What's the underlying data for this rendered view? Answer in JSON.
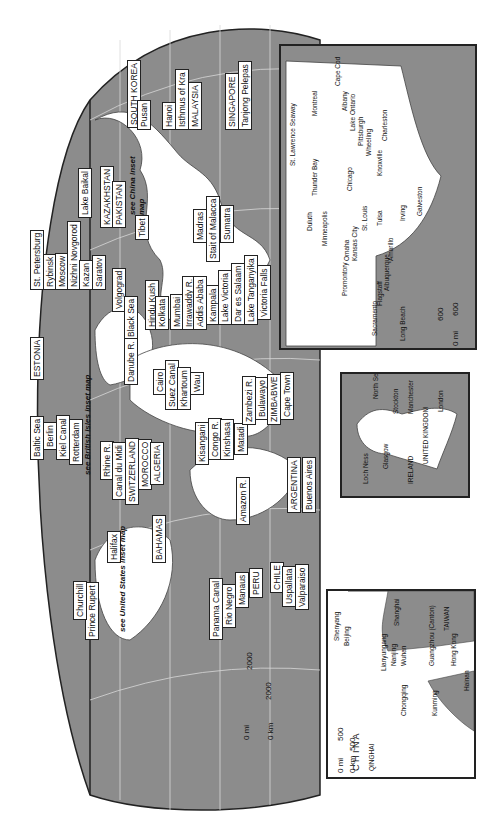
{
  "map": {
    "orientation": "rotated 90 degrees counter-clockwise",
    "colors": {
      "ocean": "#8c8c8c",
      "land": "#ffffff",
      "border": "#222222",
      "grid": "#d8d8d8"
    },
    "labels": {
      "asia": [
        "SOUTH KOREA",
        "Pusan",
        "Hanoi",
        "Isthmus of Kra",
        "MALAYSIA",
        "SINGAPORE",
        "Tanjong Pelepas",
        "Lake Baikal",
        "KAZAKHSTAN",
        "PAKISTAN",
        "Tibet",
        "Madras",
        "Stait of Malacca",
        "Sumatra",
        "Hindu Kush",
        "Kolkata",
        "Mumbai",
        "Irrawaddy R."
      ],
      "europe": [
        "St. Petersburg",
        "Rybinsk",
        "Moscow",
        "Nizhni Novgorod",
        "Kazan",
        "Saratov",
        "Volgograd",
        "Black Sea",
        "ESTONIA",
        "Danube R.",
        "Baltic Sea",
        "Berlin",
        "Kiel Canal",
        "Rotterdam",
        "Rhine R.",
        "Canal du Midi",
        "SWITZERLAND",
        "MOROCCO",
        "ALGERIA"
      ],
      "africa": [
        "Addis Ababa",
        "Kampala",
        "Lake Victoria",
        "Dar es Salaam",
        "Lake Tanganyika",
        "Victoria Falls",
        "Cairo",
        "Suez Canal",
        "Khartoum",
        "Wau",
        "Kisangani",
        "Congo R.",
        "Kinshasa",
        "Matadi",
        "Zambezi R.",
        "Bulawayo",
        "ZIMBABWE",
        "Cape Town"
      ],
      "americas": [
        "Amazon R.",
        "ARGENTINA",
        "Buenos Aires",
        "CHILE",
        "Uspallata",
        "Valparaiso",
        "PERU",
        "Manaus",
        "Rio Negro",
        "Panama Canal",
        "BAHAMAS",
        "Halifax",
        "Prince Rupert",
        "Churchill"
      ],
      "notes": [
        "see China inset map",
        "see British Isles inset map",
        "see United States inset map"
      ]
    },
    "scale": {
      "mi_zero": "0 mi",
      "mi_value": "2000",
      "km_zero": "0 km",
      "km_value": "2000"
    }
  },
  "us_inset": {
    "labels": [
      "Cape Cod",
      "Troy",
      "Albany",
      "Lake Ontario",
      "Pittsburgh",
      "Wheeling",
      "Montreal",
      "St. Lawrence Seaway",
      "Thunder Bay",
      "Buffalo",
      "Chicago",
      "Knoxville",
      "Charleston",
      "Tombigbee R.",
      "Ohio R.",
      "Tennessee R.",
      "Duluth",
      "Minneapolis",
      "Council Bluffs",
      "St. Louis",
      "Mississippi R.",
      "Omaha",
      "Kansas City",
      "Arkansas R.",
      "Tulsa",
      "Irving",
      "Galveston",
      "Royal Gorge",
      "Amarillo",
      "Promontory",
      "Colorado R.",
      "Flagstaff",
      "Albuquerque",
      "Missouri R.",
      "Snake R.",
      "Sacramento",
      "Long Beach",
      "Vancouver",
      "Columbia R."
    ],
    "scale": {
      "mi_zero": "0 mi",
      "mi_value": "600",
      "km_zero": "0 km",
      "km_value": "600"
    }
  },
  "uk_inset": {
    "labels": [
      "North Sea",
      "Stockton",
      "Darlington",
      "Manchester",
      "Liverpool",
      "London",
      "UNITED KINGDOM",
      "Bristol",
      "Glasgow",
      "Loch Ness",
      "IRELAND"
    ],
    "scale": {
      "mi_zero": "0 mi",
      "mi_value": "100",
      "km_zero": "0 km",
      "km_value": "150"
    }
  },
  "china_inset": {
    "labels": [
      "Shenyang",
      "Beijing",
      "Yellow Sea",
      "Shanghai",
      "Hangzhou",
      "TAIWAN",
      "Lianyungang",
      "Nanjing",
      "Wuhan",
      "Guangzhou (Canton)",
      "Hong Kong",
      "Shekou / Yantian",
      "Yangtze R.",
      "Chongqing",
      "Kunming",
      "Pearl R.",
      "Macau",
      "Hainan",
      "VIETNAM",
      "LAOS",
      "BURMA (MYANMAR)",
      "INDIA",
      "QINGHAI",
      "C H I N A",
      "Yellow R."
    ],
    "scale": {
      "mi_zero": "0 mi",
      "mi_value": "500",
      "km_zero": "0 km",
      "km_value": "500"
    }
  }
}
